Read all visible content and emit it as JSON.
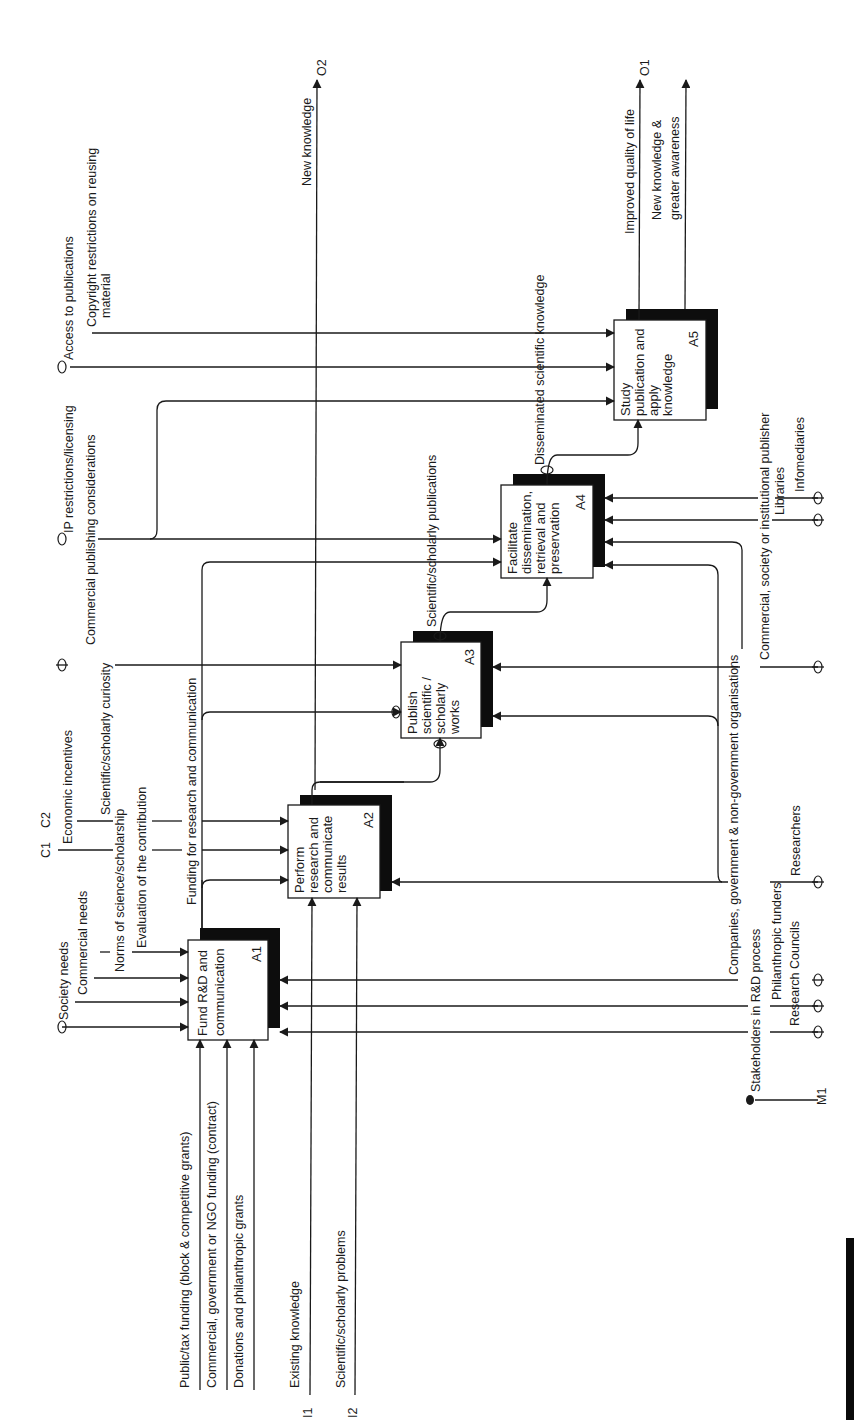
{
  "diagram": {
    "type": "IDEF0 activity diagram (rotated 90° counter-clockwise)",
    "boxes": [
      {
        "id": "A1",
        "node": "A1",
        "lines": [
          "Fund R&D and",
          "communication"
        ]
      },
      {
        "id": "A2",
        "node": "A2",
        "lines": [
          "Perform",
          "research and",
          "communicate",
          "results"
        ]
      },
      {
        "id": "A3",
        "node": "A3",
        "lines": [
          "Publish",
          "scientific /",
          "scholarly",
          "works"
        ]
      },
      {
        "id": "A4",
        "node": "A4",
        "lines": [
          "Facilitate",
          "dissemination,",
          "retrieval and",
          "preservation"
        ]
      },
      {
        "id": "A5",
        "node": "A5",
        "lines": [
          "Study",
          "publication and",
          "apply",
          "knowledge"
        ]
      }
    ],
    "inputs": {
      "i1_code": "I1",
      "i1": "Existing knowledge",
      "i2_code": "I2",
      "i2": "Scientific/scholarly problems",
      "funding": [
        "Public/tax funding (block & competitive grants)",
        "Commercial, government or NGO funding (contract)",
        "Donations and philanthropic grants"
      ]
    },
    "controls": {
      "c1_code": "C1",
      "c2_code": "C2",
      "society_needs": "Society needs",
      "commercial_needs": "Commercial needs",
      "norms": "Norms of science/scholarship",
      "evaluation": "Evaluation of the contribution",
      "economic_incentives": "Economic incentives",
      "curiosity": "Scientific/scholarly curiosity",
      "commercial_publishing": "Commercial publishing considerations",
      "ip_restrictions": "IP restrictions/licensing",
      "access": "Access to publications",
      "copyright": [
        "Copyright restrictions on reusing",
        "material"
      ]
    },
    "internal": {
      "funding_flow": "Funding for research and communication",
      "publications": "Scientific/scholarly publications",
      "disseminated": "Disseminated scientific knowledge"
    },
    "outputs": {
      "o1_code": "O1",
      "o2_code": "O2",
      "new_knowledge": "New knowledge",
      "quality_of_life": "Improved quality of life",
      "awareness": [
        "New knowledge &",
        "greater awareness"
      ]
    },
    "mechanisms": {
      "m1_code": "M1",
      "stakeholders": "Stakeholders in R&D process",
      "companies": "Companies, government & non-government organisations",
      "philanthropic": "Philanthropic funders",
      "research_councils": "Research Councils",
      "researchers": "Researchers",
      "publisher": "Commercial, society or institutional publisher",
      "libraries": "Libraries",
      "infomediaries": "Infomediaries"
    }
  }
}
